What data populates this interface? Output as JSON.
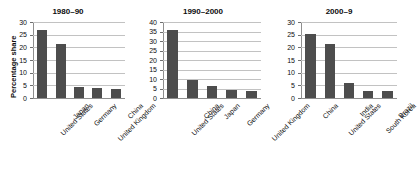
{
  "figure": {
    "ylabel": "Percentage share",
    "panels": [
      {
        "title": "1980–90",
        "ylabel": "Percentage share",
        "categories": [
          "United States",
          "Japan",
          "Germany",
          "United Kingdom",
          "China"
        ],
        "values": [
          27.0,
          21.4,
          4.5,
          4.0,
          3.6
        ],
        "ticks": [
          "0",
          "5",
          "10",
          "15",
          "20",
          "25",
          "30"
        ],
        "ymin": 0,
        "ymax": 30
      },
      {
        "title": "1990–2000",
        "ylabel": "",
        "categories": [
          "United States",
          "China",
          "Japan",
          "Germany",
          "United Kingdom"
        ],
        "values": [
          35.8,
          9.5,
          6.2,
          4.3,
          3.5
        ],
        "ticks": [
          "0",
          "5",
          "10",
          "15",
          "20",
          "25",
          "30",
          "35",
          "40"
        ],
        "ymin": 0,
        "ymax": 40
      },
      {
        "title": "2000–9",
        "ylabel": "",
        "categories": [
          "China",
          "United States",
          "India",
          "South Korea",
          "Brazil"
        ],
        "values": [
          25.3,
          21.3,
          6.0,
          2.9,
          2.8
        ],
        "ticks": [
          "0",
          "5",
          "10",
          "15",
          "20",
          "25",
          "30"
        ],
        "ymin": 0,
        "ymax": 30
      }
    ]
  },
  "colors": {
    "bar": "#4d4d4d",
    "grid": "#c2c2c2",
    "axis": "#8f8f8f",
    "text": "#0d0d0d",
    "background": "#ffffff"
  },
  "chart_data": [
    {
      "type": "bar",
      "title": "1980–90",
      "categories": [
        "United States",
        "Japan",
        "Germany",
        "United Kingdom",
        "China"
      ],
      "values": [
        27.0,
        21.4,
        4.5,
        4.0,
        3.6
      ],
      "xlabel": "",
      "ylabel": "Percentage share",
      "ylim": [
        0,
        30
      ],
      "yticks": [
        0,
        5,
        10,
        15,
        20,
        25,
        30
      ],
      "grid": true,
      "legend": false
    },
    {
      "type": "bar",
      "title": "1990–2000",
      "categories": [
        "United States",
        "China",
        "Japan",
        "Germany",
        "United Kingdom"
      ],
      "values": [
        35.8,
        9.5,
        6.2,
        4.3,
        3.5
      ],
      "xlabel": "",
      "ylabel": "",
      "ylim": [
        0,
        40
      ],
      "yticks": [
        0,
        5,
        10,
        15,
        20,
        25,
        30,
        35,
        40
      ],
      "grid": true,
      "legend": false
    },
    {
      "type": "bar",
      "title": "2000–9",
      "categories": [
        "China",
        "United States",
        "India",
        "South Korea",
        "Brazil"
      ],
      "values": [
        25.3,
        21.3,
        6.0,
        2.9,
        2.8
      ],
      "xlabel": "",
      "ylabel": "",
      "ylim": [
        0,
        30
      ],
      "yticks": [
        0,
        5,
        10,
        15,
        20,
        25,
        30
      ],
      "grid": true,
      "legend": false
    }
  ]
}
